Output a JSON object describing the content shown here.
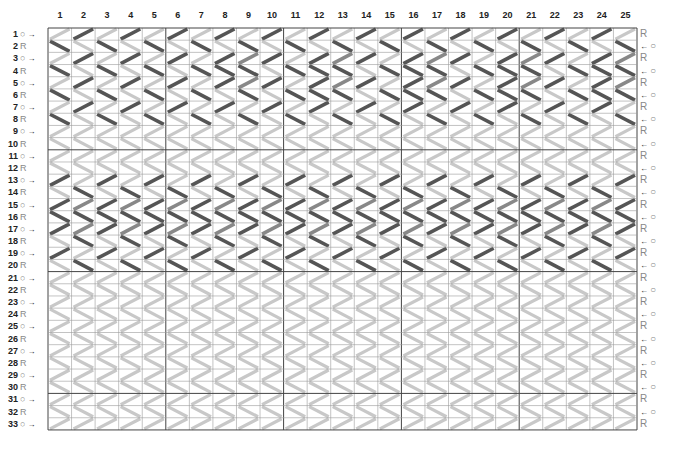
{
  "chart": {
    "type": "tablet-weaving-draft",
    "columns": [
      "1",
      "2",
      "3",
      "4",
      "5",
      "6",
      "7",
      "8",
      "9",
      "10",
      "11",
      "12",
      "13",
      "14",
      "15",
      "16",
      "17",
      "18",
      "19",
      "20",
      "21",
      "22",
      "23",
      "24",
      "25"
    ],
    "rows": [
      {
        "n": "1",
        "left": "O",
        "arrow": "→",
        "right": "R"
      },
      {
        "n": "2",
        "left": "R",
        "arrow": "",
        "right": "O"
      },
      {
        "n": "3",
        "left": "O",
        "arrow": "→",
        "right": "R"
      },
      {
        "n": "4",
        "left": "R",
        "arrow": "",
        "right": "O"
      },
      {
        "n": "5",
        "left": "O",
        "arrow": "→",
        "right": "R"
      },
      {
        "n": "6",
        "left": "R",
        "arrow": "",
        "right": "O"
      },
      {
        "n": "7",
        "left": "O",
        "arrow": "→",
        "right": "R"
      },
      {
        "n": "8",
        "left": "R",
        "arrow": "",
        "right": "O"
      },
      {
        "n": "9",
        "left": "O",
        "arrow": "→",
        "right": "R"
      },
      {
        "n": "10",
        "left": "R",
        "arrow": "",
        "right": "O"
      },
      {
        "n": "11",
        "left": "O",
        "arrow": "→",
        "right": "R"
      },
      {
        "n": "12",
        "left": "R",
        "arrow": "",
        "right": "O"
      },
      {
        "n": "13",
        "left": "O",
        "arrow": "→",
        "right": "R"
      },
      {
        "n": "14",
        "left": "R",
        "arrow": "",
        "right": "O"
      },
      {
        "n": "15",
        "left": "O",
        "arrow": "→",
        "right": "R"
      },
      {
        "n": "16",
        "left": "R",
        "arrow": "",
        "right": "O"
      },
      {
        "n": "17",
        "left": "O",
        "arrow": "→",
        "right": "R"
      },
      {
        "n": "18",
        "left": "R",
        "arrow": "",
        "right": "O"
      },
      {
        "n": "19",
        "left": "O",
        "arrow": "→",
        "right": "R"
      },
      {
        "n": "20",
        "left": "R",
        "arrow": "",
        "right": "O"
      },
      {
        "n": "21",
        "left": "O",
        "arrow": "→",
        "right": "R"
      },
      {
        "n": "22",
        "left": "R",
        "arrow": "",
        "right": "O"
      },
      {
        "n": "23",
        "left": "O",
        "arrow": "→",
        "right": "R"
      },
      {
        "n": "24",
        "left": "R",
        "arrow": "",
        "right": "O"
      },
      {
        "n": "25",
        "left": "O",
        "arrow": "→",
        "right": "R"
      },
      {
        "n": "26",
        "left": "R",
        "arrow": "",
        "right": "O"
      },
      {
        "n": "27",
        "left": "O",
        "arrow": "→",
        "right": "R"
      },
      {
        "n": "28",
        "left": "R",
        "arrow": "",
        "right": "O"
      },
      {
        "n": "29",
        "left": "O",
        "arrow": "→",
        "right": "R"
      },
      {
        "n": "30",
        "left": "R",
        "arrow": "",
        "right": "O"
      },
      {
        "n": "31",
        "left": "O",
        "arrow": "→",
        "right": "R"
      },
      {
        "n": "32",
        "left": "R",
        "arrow": "",
        "right": "O"
      },
      {
        "n": "33",
        "left": "O",
        "arrow": "→",
        "right": "R"
      }
    ],
    "right_arrow": "←",
    "cells": [
      "LDLDLDLDLDLDLDLDLDLDLDLDL",
      "DLDLDLDLDLDLDLDLDLDLDLDLD",
      "LDLDLDLDMDLDMDLDMDLDMDLDM",
      "DLDLDLDDDLDDDLDDDLDDDLDDD",
      "LDLDLDLDMDLDMDLDMDLDMDLDM",
      "DLDLDLDLDLDDDLDDDLDDDLDDD",
      "LDLDLDLDLDLDLDLDLDLDLDLDL",
      "DLDLDLDLDLDLDLDLDLDLDLDLD",
      "LLLLLLLLLLLLLLLLLLLLLLLLL",
      "LLLLLLLLLLLLLLLLLLLLLLLLL",
      "LLLLLLLLLLLLLLLLLLLLLLLLL",
      "LLLLLLLLLLLLLLLLLLLLLLLLL",
      "DLDLDLDLDLDLDLDLDLDLDLDLD",
      "LDLDLDLDLDLDLDLDLDLDLDLDL",
      "DMDMDMDMDMDMDMDMDMDMDMDMD",
      "DDDDDDDDDDDDDDDDDDDDDDDDD",
      "DMDMDMDMDMDMDMDMDMDMDMDMD",
      "LDLDLDLDLDLDLDLDLDLDLDLDL",
      "DLDLDLDLDLDLDLDLDLDLDLDLD",
      "LDLDLDLDLDLDLDLDLDLDLDLDL",
      "LLLLLLLLLLLLLLLLLLLLLLLLL",
      "LLLLLLLLLLLLLLLLLLLLLLLLL",
      "LLLLLLLLLLLLLLLLLLLLLLLLL",
      "LLLLLLLLLLLLLLLLLLLLLLLLL",
      "LLLLLLLLLLLLLLLLLLLLLLLLL",
      "LLLLLLLLLLLLLLLLLLLLLLLLL",
      "LLLLLLLLLLLLLLLLLLLLLLLLL",
      "LLLLLLLLLLLLLLLLLLLLLLLLL",
      "LLLLLLLLLLLLLLLLLLLLLLLLL",
      "LLLLLLLLLLLLLLLLLLLLLLLLL",
      "LLLLLLLLLLLLLLLLLLLLLLLLL",
      "LLLLLLLLLLLLLLLLLLLLLLLLL",
      "LLLLLLLLLLLLLLLLLLLLLLLLL"
    ],
    "colors": {
      "D": "#555555",
      "M": "#888888",
      "L": "#c8c8c8",
      "grid": "#9a9a9a",
      "major_grid": "#444444"
    },
    "major_every": 5,
    "major_row_every": 10
  }
}
